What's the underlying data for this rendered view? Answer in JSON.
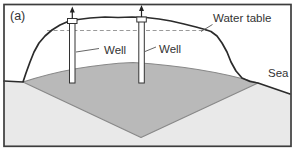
{
  "figure": {
    "panel_label": "(a)",
    "labels": {
      "water_table": "Water table",
      "well_left": "Well",
      "well_right": "Well",
      "sea": "Sea"
    },
    "colors": {
      "transition_zone_gray": "#b9b9b9",
      "sea_water_gray": "#e9e9e9",
      "outline_dark": "#2b2b2b",
      "water_table_dash": "#9a9a9a",
      "frame": "#3d3d3d",
      "background": "#ffffff"
    }
  }
}
